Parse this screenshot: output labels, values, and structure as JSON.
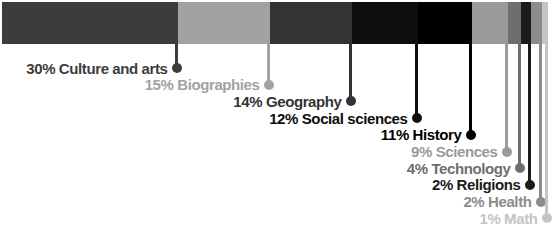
{
  "chart_data": {
    "type": "bar",
    "variant": "horizontal-stacked-single-bar-with-pin-labels",
    "title": "",
    "categories": [
      "Culture and arts",
      "Biographies",
      "Geography",
      "Social sciences",
      "History",
      "Sciences",
      "Technology",
      "Religions",
      "Health",
      "Math"
    ],
    "values": [
      30,
      15,
      14,
      12,
      11,
      9,
      4,
      2,
      2,
      1
    ],
    "labels": [
      "30% Culture and arts",
      "15% Biographies",
      "14% Geography",
      "12% Social sciences",
      "11% History",
      "9% Sciences",
      "4% Technology",
      "2% Religions",
      "2% Health",
      "1% Math"
    ],
    "colors": [
      "#3c3c3c",
      "#a2a2a2",
      "#333333",
      "#0e0e0e",
      "#000000",
      "#9a9a9a",
      "#6e6e6e",
      "#1b1b1b",
      "#8c8c8c",
      "#c4c4c4"
    ],
    "value_unit": "%",
    "values_total": 100,
    "layout": {
      "grid": "off",
      "legend_position": "stepped-below-bar-right-aligned",
      "bar_x": 2,
      "bar_y": 2,
      "bar_height": 42,
      "segment_end_px": [
        178,
        270,
        352,
        418,
        472,
        508,
        521,
        531,
        542,
        548
      ],
      "first_row_y": 68,
      "row_spacing": 16.7,
      "pin_line_width": 3,
      "pin_dot_size": 10
    }
  }
}
